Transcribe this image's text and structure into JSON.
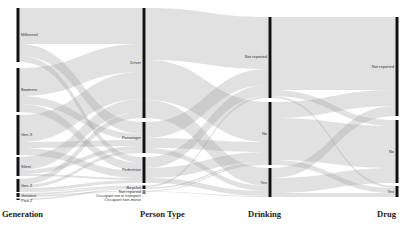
{
  "chart_data": {
    "type": "alluvial",
    "title": "",
    "axes": [
      {
        "name": "Generation",
        "x": 18,
        "label_x": 2,
        "nodes": [
          {
            "label": "Millennial",
            "y0": 8,
            "y1": 62
          },
          {
            "label": "Boomers",
            "y0": 68,
            "y1": 112
          },
          {
            "label": "Gen X",
            "y0": 115,
            "y1": 155
          },
          {
            "label": "Silent",
            "y0": 157,
            "y1": 176
          },
          {
            "label": "Gen Z",
            "y0": 179,
            "y1": 192
          },
          {
            "label": "Greatest",
            "y0": 193,
            "y1": 197
          },
          {
            "label": "Post Z",
            "y0": 198.5,
            "y1": 200
          }
        ]
      },
      {
        "name": "Person Type",
        "x": 144,
        "label_x": 140,
        "nodes": [
          {
            "label": "Driver",
            "y0": 8,
            "y1": 118
          },
          {
            "label": "Passenger",
            "y0": 122,
            "y1": 153
          },
          {
            "label": "Pedestrian",
            "y0": 157,
            "y1": 183
          },
          {
            "label": "Bicyclist",
            "y0": 185.5,
            "y1": 189
          },
          {
            "label": "Not reported",
            "y0": 190.5,
            "y1": 191.5
          },
          {
            "label": "Occupant not in transport",
            "y0": 192,
            "y1": 192.5
          },
          {
            "label": "Occupant non-motor",
            "y0": 193,
            "y1": 193.5
          }
        ]
      },
      {
        "name": "Drinking",
        "x": 270,
        "label_x": 248,
        "nodes": [
          {
            "label": "Not reported",
            "y0": 17,
            "y1": 98
          },
          {
            "label": "No",
            "y0": 102,
            "y1": 165
          },
          {
            "label": "Yes",
            "y0": 168,
            "y1": 197
          }
        ]
      },
      {
        "name": "Drug",
        "x": 397,
        "label_x": 377,
        "nodes": [
          {
            "label": "Not reported",
            "y0": 17,
            "y1": 116
          },
          {
            "label": "No",
            "y0": 120,
            "y1": 183
          },
          {
            "label": "Yes",
            "y0": 186,
            "y1": 197
          }
        ]
      }
    ],
    "flows": [
      {
        "from": [
          0,
          0
        ],
        "to": [
          1,
          0
        ],
        "sy0": 8,
        "sy1": 44,
        "ty0": 8,
        "ty1": 44
      },
      {
        "from": [
          0,
          0
        ],
        "to": [
          1,
          1
        ],
        "sy0": 44,
        "sy1": 56,
        "ty0": 122,
        "ty1": 134
      },
      {
        "from": [
          0,
          0
        ],
        "to": [
          1,
          2
        ],
        "sy0": 56,
        "sy1": 62,
        "ty0": 157,
        "ty1": 163
      },
      {
        "from": [
          0,
          1
        ],
        "to": [
          1,
          0
        ],
        "sy0": 68,
        "sy1": 96,
        "ty0": 44,
        "ty1": 72
      },
      {
        "from": [
          0,
          1
        ],
        "to": [
          1,
          1
        ],
        "sy0": 96,
        "sy1": 104,
        "ty0": 134,
        "ty1": 140
      },
      {
        "from": [
          0,
          1
        ],
        "to": [
          1,
          2
        ],
        "sy0": 104,
        "sy1": 112,
        "ty0": 163,
        "ty1": 171
      },
      {
        "from": [
          0,
          2
        ],
        "to": [
          1,
          0
        ],
        "sy0": 115,
        "sy1": 142,
        "ty0": 72,
        "ty1": 99
      },
      {
        "from": [
          0,
          2
        ],
        "to": [
          1,
          1
        ],
        "sy0": 142,
        "sy1": 148,
        "ty0": 140,
        "ty1": 146
      },
      {
        "from": [
          0,
          2
        ],
        "to": [
          1,
          2
        ],
        "sy0": 148,
        "sy1": 155,
        "ty0": 171,
        "ty1": 178
      },
      {
        "from": [
          0,
          3
        ],
        "to": [
          1,
          0
        ],
        "sy0": 157,
        "sy1": 170,
        "ty0": 99,
        "ty1": 112
      },
      {
        "from": [
          0,
          3
        ],
        "to": [
          1,
          1
        ],
        "sy0": 170,
        "sy1": 174,
        "ty0": 146,
        "ty1": 150
      },
      {
        "from": [
          0,
          3
        ],
        "to": [
          1,
          2
        ],
        "sy0": 174,
        "sy1": 176,
        "ty0": 178,
        "ty1": 180
      },
      {
        "from": [
          0,
          4
        ],
        "to": [
          1,
          0
        ],
        "sy0": 179,
        "sy1": 185,
        "ty0": 112,
        "ty1": 118
      },
      {
        "from": [
          0,
          4
        ],
        "to": [
          1,
          1
        ],
        "sy0": 185,
        "sy1": 188,
        "ty0": 150,
        "ty1": 153
      },
      {
        "from": [
          0,
          4
        ],
        "to": [
          1,
          2
        ],
        "sy0": 188,
        "sy1": 191,
        "ty0": 180,
        "ty1": 183
      },
      {
        "from": [
          0,
          4
        ],
        "to": [
          1,
          3
        ],
        "sy0": 191,
        "sy1": 192,
        "ty0": 185.5,
        "ty1": 186.5
      },
      {
        "from": [
          0,
          5
        ],
        "to": [
          1,
          3
        ],
        "sy0": 193,
        "sy1": 195,
        "ty0": 186.5,
        "ty1": 188
      },
      {
        "from": [
          0,
          5
        ],
        "to": [
          1,
          4
        ],
        "sy0": 195,
        "sy1": 197,
        "ty0": 190.5,
        "ty1": 191.5
      },
      {
        "from": [
          0,
          6
        ],
        "to": [
          1,
          3
        ],
        "sy0": 198.5,
        "sy1": 200,
        "ty0": 188,
        "ty1": 189
      },
      {
        "from": [
          1,
          0
        ],
        "to": [
          2,
          0
        ],
        "sy0": 8,
        "sy1": 60,
        "ty0": 17,
        "ty1": 69
      },
      {
        "from": [
          1,
          0
        ],
        "to": [
          2,
          1
        ],
        "sy0": 60,
        "sy1": 100,
        "ty0": 102,
        "ty1": 142
      },
      {
        "from": [
          1,
          0
        ],
        "to": [
          2,
          2
        ],
        "sy0": 100,
        "sy1": 118,
        "ty0": 168,
        "ty1": 186
      },
      {
        "from": [
          1,
          1
        ],
        "to": [
          2,
          0
        ],
        "sy0": 122,
        "sy1": 138,
        "ty0": 69,
        "ty1": 85
      },
      {
        "from": [
          1,
          1
        ],
        "to": [
          2,
          1
        ],
        "sy0": 138,
        "sy1": 148,
        "ty0": 142,
        "ty1": 152
      },
      {
        "from": [
          1,
          1
        ],
        "to": [
          2,
          2
        ],
        "sy0": 148,
        "sy1": 153,
        "ty0": 186,
        "ty1": 191
      },
      {
        "from": [
          1,
          2
        ],
        "to": [
          2,
          0
        ],
        "sy0": 157,
        "sy1": 168,
        "ty0": 85,
        "ty1": 96
      },
      {
        "from": [
          1,
          2
        ],
        "to": [
          2,
          1
        ],
        "sy0": 168,
        "sy1": 178,
        "ty0": 152,
        "ty1": 162
      },
      {
        "from": [
          1,
          2
        ],
        "to": [
          2,
          2
        ],
        "sy0": 178,
        "sy1": 183,
        "ty0": 191,
        "ty1": 196
      },
      {
        "from": [
          1,
          3
        ],
        "to": [
          2,
          0
        ],
        "sy0": 185.5,
        "sy1": 187.5,
        "ty0": 96,
        "ty1": 98
      },
      {
        "from": [
          1,
          3
        ],
        "to": [
          2,
          1
        ],
        "sy0": 187.5,
        "sy1": 189,
        "ty0": 162,
        "ty1": 163.5
      },
      {
        "from": [
          1,
          4
        ],
        "to": [
          2,
          1
        ],
        "sy0": 190.5,
        "sy1": 191.5,
        "ty0": 163.5,
        "ty1": 165
      },
      {
        "from": [
          1,
          4
        ],
        "to": [
          2,
          2
        ],
        "sy0": 191.5,
        "sy1": 192,
        "ty0": 196,
        "ty1": 197
      },
      {
        "from": [
          2,
          0
        ],
        "to": [
          3,
          0
        ],
        "sy0": 17,
        "sy1": 90,
        "ty0": 17,
        "ty1": 90
      },
      {
        "from": [
          2,
          0
        ],
        "to": [
          3,
          1
        ],
        "sy0": 90,
        "sy1": 96,
        "ty0": 120,
        "ty1": 126
      },
      {
        "from": [
          2,
          0
        ],
        "to": [
          3,
          2
        ],
        "sy0": 96,
        "sy1": 98,
        "ty0": 186,
        "ty1": 188
      },
      {
        "from": [
          2,
          1
        ],
        "to": [
          3,
          0
        ],
        "sy0": 102,
        "sy1": 118,
        "ty0": 90,
        "ty1": 106
      },
      {
        "from": [
          2,
          1
        ],
        "to": [
          3,
          1
        ],
        "sy0": 118,
        "sy1": 160,
        "ty0": 126,
        "ty1": 168
      },
      {
        "from": [
          2,
          1
        ],
        "to": [
          3,
          2
        ],
        "sy0": 160,
        "sy1": 165,
        "ty0": 188,
        "ty1": 193
      },
      {
        "from": [
          2,
          2
        ],
        "to": [
          3,
          0
        ],
        "sy0": 168,
        "sy1": 178,
        "ty0": 106,
        "ty1": 116
      },
      {
        "from": [
          2,
          2
        ],
        "to": [
          3,
          1
        ],
        "sy0": 178,
        "sy1": 193,
        "ty0": 168,
        "ty1": 183
      },
      {
        "from": [
          2,
          2
        ],
        "to": [
          3,
          2
        ],
        "sy0": 193,
        "sy1": 197,
        "ty0": 193,
        "ty1": 197
      }
    ],
    "colors": {
      "flow": "#9a9a9a",
      "flow_opacity": 0.3,
      "bar": "#111111",
      "label": "#333333",
      "axis_label": "#222222"
    }
  }
}
